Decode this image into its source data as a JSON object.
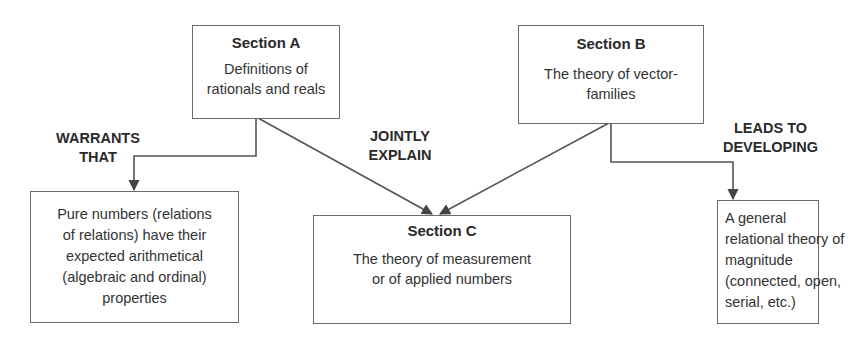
{
  "diagram": {
    "nodes": {
      "section_a": {
        "title": "Section A",
        "text": "Definitions of rationals and reals",
        "lines": [
          "Definitions of",
          "rationals and reals"
        ]
      },
      "section_b": {
        "title": "Section B",
        "text": "The theory of vector-families",
        "lines": [
          "The theory of vector-",
          "families"
        ]
      },
      "section_c": {
        "title": "Section C",
        "text": "The theory of measurement or of applied numbers",
        "lines": [
          "The theory of measurement",
          "or of applied numbers"
        ]
      },
      "pure_numbers": {
        "text": "Pure numbers (relations of relations) have their expected arithmetical (algebraic and ordinal) properties",
        "lines": [
          "Pure numbers (relations",
          "of relations) have their",
          "expected arithmetical",
          "(algebraic and ordinal)",
          "properties"
        ]
      },
      "magnitude": {
        "text": "A general relational theory of magnitude (connected, open, serial, etc.)",
        "lines": [
          "A general",
          "relational theory of",
          "magnitude",
          "(connected, open,",
          "serial, etc.)"
        ]
      }
    },
    "edges": {
      "warrants": {
        "from": "Section A",
        "to": "Pure numbers",
        "lines": [
          "WARRANTS",
          "THAT"
        ]
      },
      "jointly": {
        "from": [
          "Section A",
          "Section B"
        ],
        "to": "Section C",
        "lines": [
          "JOINTLY",
          "EXPLAIN"
        ]
      },
      "leads": {
        "from": "Section B",
        "to": "General theory of magnitude",
        "lines": [
          "LEADS TO",
          "DEVELOPING"
        ]
      }
    },
    "colors": {
      "line": "#555555",
      "text": "#2a2a2a",
      "border": "#6a6a6a"
    }
  }
}
